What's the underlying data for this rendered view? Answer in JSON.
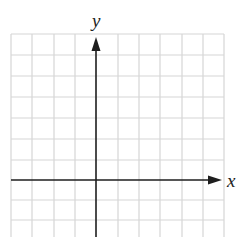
{
  "diagram": {
    "type": "coordinate-grid",
    "x_axis_label": "x",
    "y_axis_label": "y",
    "grid": {
      "columns": 10,
      "visible_rows": 10,
      "origin_column": 4,
      "origin_row": 7
    },
    "colors": {
      "grid_line": "#d4d4d4",
      "axis": "#1e1e1e",
      "label": "#222222",
      "background": "#ffffff"
    }
  }
}
